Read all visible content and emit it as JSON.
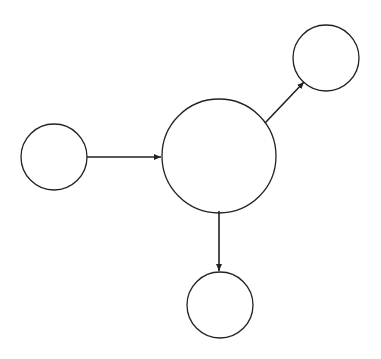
{
  "diagram": {
    "background": "#ffffff",
    "stroke_color": "#222222",
    "nodes": [
      {
        "id": "left",
        "cx": 54,
        "cy": 157,
        "r": 33,
        "label": ""
      },
      {
        "id": "center",
        "cx": 219,
        "cy": 156,
        "r": 57,
        "label": ""
      },
      {
        "id": "top-right",
        "cx": 326,
        "cy": 58,
        "r": 33,
        "label": ""
      },
      {
        "id": "bottom",
        "cx": 220,
        "cy": 305,
        "r": 33,
        "label": ""
      }
    ],
    "edges": [
      {
        "from": "left",
        "to": "center"
      },
      {
        "from": "center",
        "to": "top-right"
      },
      {
        "from": "center",
        "to": "bottom"
      }
    ]
  }
}
